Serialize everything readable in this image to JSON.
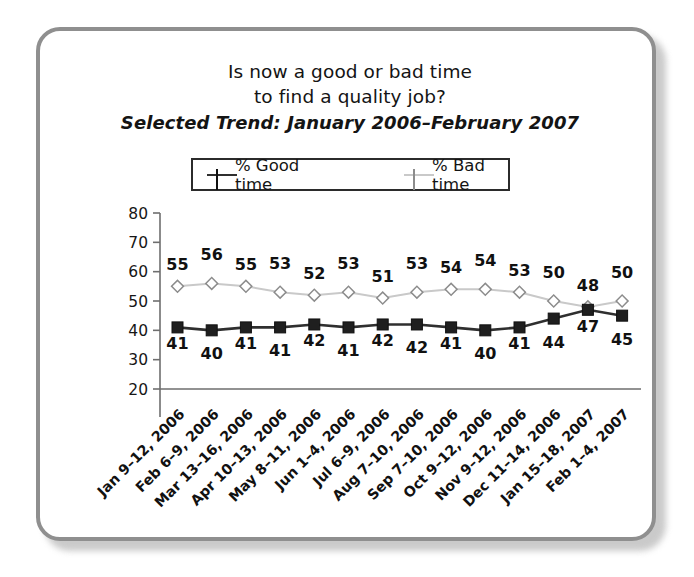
{
  "figure": {
    "title_lines": [
      "Is now a good or bad time",
      "to find a quality job?"
    ],
    "subtitle": "Selected Trend: January 2006–February 2007"
  },
  "legend": {
    "position": "top-center",
    "entries": [
      {
        "label": "% Good time",
        "marker": "filled-square",
        "color": "#2f2f2f"
      },
      {
        "label": "% Bad time",
        "marker": "open-diamond",
        "color": "#c9c9c9"
      }
    ]
  },
  "chart_data": {
    "type": "line",
    "title": "Is now a good or bad time to find a quality job?",
    "subtitle": "Selected Trend: January 2006–February 2007",
    "xlabel": "",
    "ylabel": "",
    "ylim": [
      20,
      80
    ],
    "yticks": [
      20,
      30,
      40,
      50,
      60,
      70,
      80
    ],
    "grid": false,
    "legend_position": "top-center",
    "categories": [
      "Jan 9–12, 2006",
      "Feb 6–9, 2006",
      "Mar 13–16, 2006",
      "Apr 10–13, 2006",
      "May 8–11, 2006",
      "Jun 1–4, 2006",
      "Jul 6–9, 2006",
      "Aug 7–10, 2006",
      "Sep 7–10, 2006",
      "Oct 9–12, 2006",
      "Nov 9–12, 2006",
      "Dec 11–14, 2006",
      "Jan 15–18, 2007",
      "Feb 1–4, 2007"
    ],
    "series": [
      {
        "name": "% Good time",
        "marker": "filled-square",
        "color": "#2f2f2f",
        "label_position": "below",
        "values": [
          41,
          40,
          41,
          41,
          42,
          41,
          42,
          42,
          41,
          40,
          41,
          44,
          47,
          45
        ]
      },
      {
        "name": "% Bad time",
        "marker": "open-diamond",
        "color": "#c9c9c9",
        "label_position": "above",
        "values": [
          55,
          56,
          55,
          53,
          52,
          53,
          51,
          53,
          54,
          54,
          53,
          50,
          48,
          50
        ]
      }
    ]
  },
  "colors": {
    "frame": "#8f8f8f",
    "good_line": "#2f2f2f",
    "bad_line": "#c9c9c9",
    "axis": "#6e6e6e",
    "text": "#141414",
    "background": "#ffffff"
  }
}
